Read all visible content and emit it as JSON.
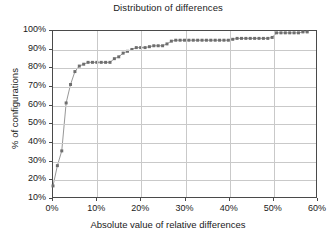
{
  "chart_data": {
    "type": "line",
    "title": "Distribution of differences",
    "xlabel": "Absolute value of relative differences",
    "ylabel": "% of configurations",
    "xlim": [
      0,
      60
    ],
    "ylim": [
      10,
      100
    ],
    "xtick_labels": [
      "0%",
      "10%",
      "20%",
      "30%",
      "40%",
      "50%",
      "60%"
    ],
    "xtick_values": [
      0,
      10,
      20,
      30,
      40,
      50,
      60
    ],
    "ytick_labels": [
      "10%",
      "20%",
      "30%",
      "40%",
      "50%",
      "60%",
      "70%",
      "80%",
      "90%",
      "100%"
    ],
    "ytick_values": [
      10,
      20,
      30,
      40,
      50,
      60,
      70,
      80,
      90,
      100
    ],
    "grid": true,
    "legend": false,
    "marker": "square",
    "marker_color": "#6e6e6e",
    "line_color": "#8a8a8a",
    "series": [
      {
        "name": "cumulative distribution",
        "x": [
          0,
          1,
          2,
          3,
          4,
          5,
          6,
          7,
          8,
          9,
          10,
          11,
          12,
          13,
          14,
          15,
          16,
          17,
          18,
          19,
          20,
          21,
          22,
          23,
          24,
          25,
          26,
          27,
          28,
          29,
          30,
          31,
          32,
          33,
          34,
          35,
          36,
          37,
          38,
          39,
          40,
          41,
          42,
          43,
          44,
          45,
          46,
          47,
          48,
          49,
          50,
          51,
          52,
          53,
          54,
          55,
          56,
          57,
          58
        ],
        "y": [
          16,
          27,
          35,
          61,
          71,
          78,
          81,
          82,
          83,
          83,
          83,
          83,
          83,
          83,
          85,
          86,
          88,
          89,
          90,
          91,
          91,
          91,
          91.5,
          92,
          92,
          92,
          93,
          94.5,
          95,
          95,
          95,
          95,
          95,
          95,
          95,
          95,
          95,
          95,
          95,
          95,
          95,
          95.5,
          96,
          96,
          96,
          96,
          96,
          96,
          96,
          96,
          96.5,
          99,
          99,
          99,
          99,
          99,
          99,
          99.5,
          99.5
        ]
      }
    ]
  }
}
